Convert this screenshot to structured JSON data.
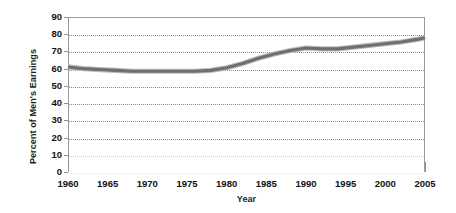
{
  "chart_data": {
    "type": "line",
    "title": "",
    "xlabel": "Year",
    "ylabel": "Percent of Men's Earnings",
    "xlim": [
      1960,
      2005
    ],
    "ylim": [
      0,
      90
    ],
    "grid": true,
    "legend_position": "none",
    "x_tick_labels": [
      "1960",
      "1965",
      "1970",
      "1975",
      "1980",
      "1985",
      "1990",
      "1995",
      "2000",
      "2005"
    ],
    "x_ticks": [
      1960,
      1965,
      1970,
      1975,
      1980,
      1985,
      1990,
      1995,
      2000,
      2005
    ],
    "y_tick_labels": [
      "90",
      "80",
      "70",
      "60",
      "50",
      "40",
      "30",
      "20",
      "10",
      "0"
    ],
    "y_ticks": [
      90,
      80,
      70,
      60,
      50,
      40,
      30,
      20,
      10,
      0
    ],
    "series": [
      {
        "name": "Women's earnings as a percent of men's earnings",
        "color": "#6f6f6f",
        "x": [
          1960,
          1962,
          1964,
          1966,
          1968,
          1970,
          1972,
          1974,
          1976,
          1978,
          1980,
          1982,
          1984,
          1986,
          1988,
          1990,
          1992,
          1994,
          1996,
          1998,
          2000,
          2002,
          2004,
          2005
        ],
        "values": [
          61,
          60,
          59.5,
          59,
          58.5,
          58.5,
          58.5,
          58.5,
          58.5,
          59,
          60.5,
          63,
          66,
          68.5,
          70.5,
          72,
          71.5,
          71.5,
          72.5,
          73.5,
          74.5,
          75.5,
          77,
          78
        ]
      }
    ]
  },
  "axes": {
    "y_title": "Percent of Men's Earnings",
    "x_title": "Year"
  }
}
